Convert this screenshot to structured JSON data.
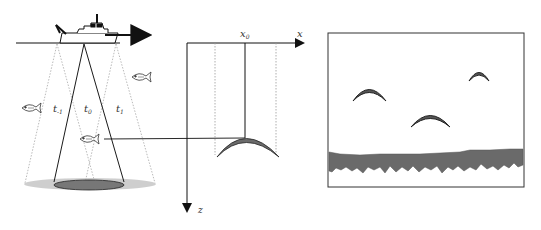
{
  "figure": {
    "left_panel": {
      "description": "Survey vessel with transducer beam pinging fish at successive times",
      "beam_labels": {
        "prev": "t",
        "prev_sub": "-1",
        "curr": "t",
        "curr_sub": "0",
        "next": "t",
        "next_sub": "1"
      },
      "fish_count": 3
    },
    "middle_panel": {
      "x_axis_label": "x",
      "z_axis_label": "z",
      "x0_label": "x",
      "x0_sub": "0"
    },
    "right_panel": {
      "description": "Echogram showing three fish arches above seabed echo",
      "arch_count": 3
    },
    "colors": {
      "line": "#1a1a1a",
      "dotted": "#9a9a9a",
      "arc_fill": "#6b6b6b",
      "seabed": "#6a6a6a",
      "seabed_halo": "#b5b5b5"
    }
  }
}
